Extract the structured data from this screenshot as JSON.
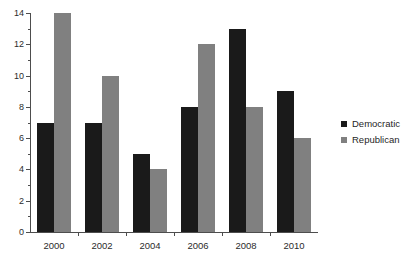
{
  "chart_data": {
    "type": "bar",
    "title": "",
    "subtitle": "",
    "xlabel": "",
    "ylabel": "",
    "categories": [
      "2000",
      "2002",
      "2004",
      "2006",
      "2008",
      "2010"
    ],
    "series": [
      {
        "name": "Democratic",
        "color": "#1a1a1a",
        "values": [
          7,
          7,
          5,
          8,
          13,
          9
        ]
      },
      {
        "name": "Republican",
        "color": "#808080",
        "values": [
          14,
          10,
          4,
          12,
          8,
          6
        ]
      }
    ],
    "ylim": [
      0,
      14
    ],
    "ytick_labels": [
      "0",
      "2",
      "4",
      "6",
      "8",
      "10",
      "12",
      "14"
    ],
    "ytick_values": [
      0,
      2,
      4,
      6,
      8,
      10,
      12,
      14
    ],
    "yminor_values": [
      1,
      3,
      5,
      7,
      9,
      11,
      13
    ],
    "grid": false,
    "legend_position": "right",
    "legend": [
      {
        "label": "Democratic",
        "color": "#1a1a1a"
      },
      {
        "label": "Republican",
        "color": "#808080"
      }
    ]
  },
  "axes": {
    "y_labels": [
      "14",
      "12",
      "10",
      "8",
      "6",
      "4",
      "2",
      "0"
    ],
    "x_labels": [
      "2000",
      "2002",
      "2004",
      "2006",
      "2008",
      "2010"
    ]
  },
  "legend": {
    "items": [
      {
        "label": "Democratic"
      },
      {
        "label": "Republican"
      }
    ]
  }
}
